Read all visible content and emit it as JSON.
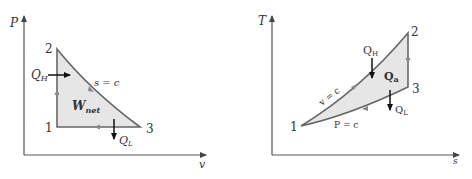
{
  "colors": {
    "axis": "#555555",
    "curve": "#666666",
    "fill": "#e6e6e6",
    "arrow": "#111111",
    "text": "#333333"
  },
  "pv_diagram": {
    "y_axis_label": "P",
    "x_axis_label": "v",
    "states": {
      "s1": "1",
      "s2": "2",
      "s3": "3"
    },
    "heat_in_label": "Q",
    "heat_in_sub": "H",
    "heat_out_label": "Q",
    "heat_out_sub": "L",
    "process_label": "s = c",
    "work_label": "W",
    "work_sub": "net"
  },
  "ts_diagram": {
    "y_axis_label": "T",
    "x_axis_label": "s",
    "states": {
      "s1": "1",
      "s2": "2",
      "s3": "3"
    },
    "heat_in_label": "Q",
    "heat_in_sub": "H",
    "heat_out_label": "Q",
    "heat_out_sub": "L",
    "area_label": "Q",
    "area_sub": "a",
    "process_12_label": "v = c",
    "process_31_label": "P = c"
  }
}
